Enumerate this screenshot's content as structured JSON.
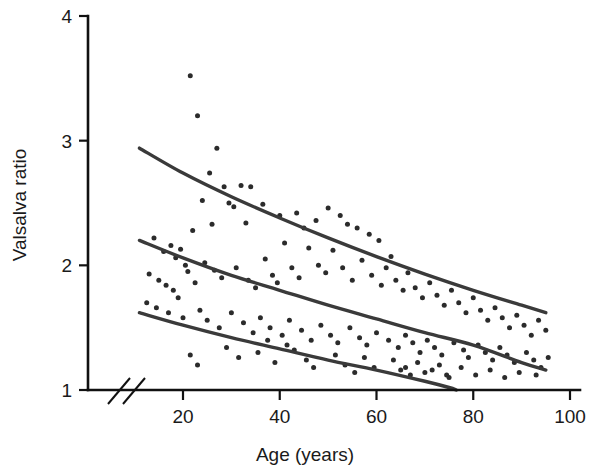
{
  "figure": {
    "background": "#ffffff",
    "ink_color": "#1a1a1a"
  },
  "axes": {
    "x_title": "Age (years)",
    "y_title": "Valsalva ratio",
    "x_ticks": [
      "20",
      "40",
      "60",
      "80",
      "100"
    ],
    "y_ticks": [
      "1",
      "2",
      "3",
      "4"
    ],
    "axis_break_symbol": "//"
  },
  "chart_data": {
    "type": "scatter",
    "title": "",
    "xlabel": "Age (years)",
    "ylabel": "Valsalva ratio",
    "xlim": [
      10,
      100
    ],
    "ylim": [
      1,
      4
    ],
    "xticks": [
      20,
      40,
      60,
      80,
      100
    ],
    "yticks": [
      1,
      2,
      3,
      4
    ],
    "grid": false,
    "legend": "none",
    "x_axis_break": true,
    "x_axis_break_note": "break between 0 and ~10 years indicated by double slash",
    "marker_color": "#2b2b2b",
    "marker_size_px": 5,
    "curve_color": "#3a3a3a",
    "series": [
      {
        "name": "Upper reference limit",
        "type": "line",
        "points": [
          [
            11,
            2.94
          ],
          [
            20,
            2.74
          ],
          [
            30,
            2.55
          ],
          [
            40,
            2.38
          ],
          [
            50,
            2.22
          ],
          [
            60,
            2.07
          ],
          [
            70,
            1.93
          ],
          [
            80,
            1.8
          ],
          [
            90,
            1.68
          ],
          [
            95,
            1.62
          ]
        ]
      },
      {
        "name": "Median reference",
        "type": "line",
        "points": [
          [
            11,
            2.2
          ],
          [
            20,
            2.06
          ],
          [
            30,
            1.92
          ],
          [
            40,
            1.8
          ],
          [
            50,
            1.68
          ],
          [
            60,
            1.57
          ],
          [
            70,
            1.46
          ],
          [
            80,
            1.36
          ],
          [
            90,
            1.22
          ],
          [
            95,
            1.16
          ]
        ]
      },
      {
        "name": "Lower reference limit",
        "type": "line",
        "points": [
          [
            11,
            1.62
          ],
          [
            20,
            1.52
          ],
          [
            30,
            1.42
          ],
          [
            40,
            1.33
          ],
          [
            50,
            1.24
          ],
          [
            60,
            1.16
          ],
          [
            70,
            1.07
          ],
          [
            75,
            1.02
          ],
          [
            76.5,
            1.0
          ]
        ]
      },
      {
        "name": "Subjects",
        "type": "scatter",
        "points": [
          [
            21.5,
            3.52
          ],
          [
            23.0,
            3.2
          ],
          [
            27.0,
            2.94
          ],
          [
            25.5,
            2.74
          ],
          [
            28.5,
            2.63
          ],
          [
            32.0,
            2.64
          ],
          [
            34.0,
            2.63
          ],
          [
            24.0,
            2.52
          ],
          [
            29.5,
            2.5
          ],
          [
            30.5,
            2.47
          ],
          [
            36.5,
            2.49
          ],
          [
            22.0,
            2.28
          ],
          [
            26.0,
            2.33
          ],
          [
            33.0,
            2.34
          ],
          [
            40.0,
            2.4
          ],
          [
            43.5,
            2.42
          ],
          [
            45.0,
            2.3
          ],
          [
            47.5,
            2.36
          ],
          [
            50.0,
            2.46
          ],
          [
            52.5,
            2.4
          ],
          [
            54.0,
            2.33
          ],
          [
            56.0,
            2.3
          ],
          [
            58.5,
            2.25
          ],
          [
            60.5,
            2.2
          ],
          [
            63.0,
            2.07
          ],
          [
            14.0,
            2.22
          ],
          [
            16.0,
            2.11
          ],
          [
            17.5,
            2.16
          ],
          [
            18.5,
            2.06
          ],
          [
            19.5,
            2.13
          ],
          [
            20.5,
            2.0
          ],
          [
            21.0,
            1.95
          ],
          [
            13.0,
            1.93
          ],
          [
            15.0,
            1.88
          ],
          [
            16.5,
            1.84
          ],
          [
            18.0,
            1.8
          ],
          [
            19.0,
            1.74
          ],
          [
            22.5,
            1.86
          ],
          [
            24.5,
            2.02
          ],
          [
            26.5,
            1.96
          ],
          [
            28.0,
            1.9
          ],
          [
            31.0,
            1.98
          ],
          [
            33.5,
            1.88
          ],
          [
            35.0,
            1.82
          ],
          [
            37.0,
            2.05
          ],
          [
            38.5,
            1.92
          ],
          [
            39.5,
            1.86
          ],
          [
            41.0,
            2.18
          ],
          [
            42.5,
            1.98
          ],
          [
            44.0,
            1.9
          ],
          [
            46.0,
            2.14
          ],
          [
            48.0,
            2.0
          ],
          [
            49.5,
            1.94
          ],
          [
            51.0,
            2.12
          ],
          [
            53.0,
            1.98
          ],
          [
            55.0,
            1.88
          ],
          [
            57.0,
            2.04
          ],
          [
            59.0,
            1.92
          ],
          [
            61.0,
            1.84
          ],
          [
            62.0,
            1.98
          ],
          [
            64.0,
            1.88
          ],
          [
            65.5,
            1.8
          ],
          [
            66.5,
            1.94
          ],
          [
            68.0,
            1.82
          ],
          [
            69.5,
            1.74
          ],
          [
            71.0,
            1.86
          ],
          [
            72.5,
            1.76
          ],
          [
            74.0,
            1.68
          ],
          [
            75.5,
            1.8
          ],
          [
            77.0,
            1.7
          ],
          [
            78.5,
            1.62
          ],
          [
            80.0,
            1.74
          ],
          [
            81.5,
            1.64
          ],
          [
            83.0,
            1.56
          ],
          [
            84.5,
            1.66
          ],
          [
            86.0,
            1.58
          ],
          [
            87.5,
            1.5
          ],
          [
            89.0,
            1.6
          ],
          [
            90.5,
            1.52
          ],
          [
            92.0,
            1.44
          ],
          [
            93.5,
            1.56
          ],
          [
            95.0,
            1.48
          ],
          [
            12.5,
            1.7
          ],
          [
            14.5,
            1.66
          ],
          [
            17.0,
            1.62
          ],
          [
            20.0,
            1.58
          ],
          [
            23.5,
            1.64
          ],
          [
            25.0,
            1.56
          ],
          [
            27.5,
            1.5
          ],
          [
            30.0,
            1.62
          ],
          [
            32.5,
            1.54
          ],
          [
            34.5,
            1.46
          ],
          [
            36.0,
            1.58
          ],
          [
            38.0,
            1.5
          ],
          [
            40.5,
            1.44
          ],
          [
            42.0,
            1.56
          ],
          [
            44.5,
            1.48
          ],
          [
            46.5,
            1.4
          ],
          [
            48.5,
            1.52
          ],
          [
            50.5,
            1.44
          ],
          [
            52.0,
            1.38
          ],
          [
            54.5,
            1.5
          ],
          [
            56.5,
            1.42
          ],
          [
            58.0,
            1.36
          ],
          [
            60.0,
            1.46
          ],
          [
            62.5,
            1.4
          ],
          [
            64.5,
            1.34
          ],
          [
            66.0,
            1.44
          ],
          [
            67.5,
            1.38
          ],
          [
            69.0,
            1.3
          ],
          [
            70.5,
            1.4
          ],
          [
            72.0,
            1.34
          ],
          [
            73.5,
            1.28
          ],
          [
            76.0,
            1.38
          ],
          [
            78.0,
            1.32
          ],
          [
            79.0,
            1.26
          ],
          [
            81.0,
            1.36
          ],
          [
            82.5,
            1.3
          ],
          [
            84.0,
            1.24
          ],
          [
            85.5,
            1.34
          ],
          [
            87.0,
            1.28
          ],
          [
            88.5,
            1.22
          ],
          [
            91.0,
            1.3
          ],
          [
            92.5,
            1.24
          ],
          [
            94.0,
            1.18
          ],
          [
            95.5,
            1.26
          ],
          [
            21.5,
            1.28
          ],
          [
            23.0,
            1.2
          ],
          [
            29.0,
            1.34
          ],
          [
            31.5,
            1.26
          ],
          [
            35.5,
            1.3
          ],
          [
            39.0,
            1.22
          ],
          [
            43.0,
            1.32
          ],
          [
            45.5,
            1.24
          ],
          [
            47.0,
            1.18
          ],
          [
            51.5,
            1.28
          ],
          [
            53.5,
            1.2
          ],
          [
            55.5,
            1.14
          ],
          [
            57.5,
            1.26
          ],
          [
            59.5,
            1.18
          ],
          [
            63.5,
            1.24
          ],
          [
            65.0,
            1.16
          ],
          [
            68.5,
            1.22
          ],
          [
            70.0,
            1.14
          ],
          [
            73.0,
            1.2
          ],
          [
            74.5,
            1.12
          ],
          [
            77.5,
            1.18
          ],
          [
            80.5,
            1.12
          ],
          [
            83.5,
            1.16
          ],
          [
            86.5,
            1.1
          ],
          [
            89.5,
            1.14
          ],
          [
            93.0,
            1.12
          ],
          [
            66.0,
            1.18
          ],
          [
            67.0,
            1.12
          ],
          [
            71.5,
            1.16
          ],
          [
            75.0,
            1.1
          ],
          [
            41.5,
            1.36
          ],
          [
            37.5,
            1.4
          ]
        ]
      }
    ]
  }
}
